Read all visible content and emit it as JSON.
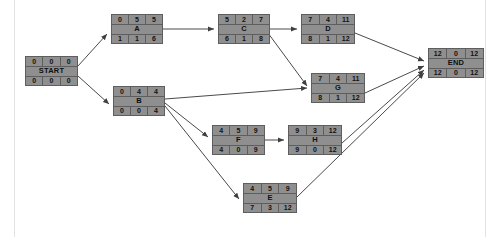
{
  "diagram": {
    "type": "activity-on-node-network",
    "title": "",
    "colors": {
      "node_fill": "#8f8f8f",
      "node_border": "#5e5e5e",
      "edge": "#4a4a4a",
      "background": "#ffffff",
      "frame_border": "#e3e3e3"
    },
    "cell_headers": {
      "top": [
        "early_start",
        "duration",
        "early_finish"
      ],
      "bottom": [
        "late_start",
        "slack",
        "late_finish"
      ]
    },
    "nodes": [
      {
        "id": "START",
        "label": "START",
        "top": [
          "0",
          "0",
          "0"
        ],
        "bottom": [
          "0",
          "0",
          "0"
        ],
        "x": 25,
        "y": 56,
        "w": 53,
        "h": 30
      },
      {
        "id": "A",
        "label": "A",
        "top": [
          "0",
          "5",
          "5"
        ],
        "bottom": [
          "1",
          "1",
          "6"
        ],
        "x": 111,
        "y": 14,
        "w": 52,
        "h": 30
      },
      {
        "id": "B",
        "label": "B",
        "top": [
          "0",
          "4",
          "4"
        ],
        "bottom": [
          "0",
          "0",
          "4"
        ],
        "x": 113,
        "y": 86,
        "w": 52,
        "h": 30
      },
      {
        "id": "C",
        "label": "C",
        "top": [
          "5",
          "2",
          "7"
        ],
        "bottom": [
          "6",
          "1",
          "8"
        ],
        "x": 218,
        "y": 14,
        "w": 52,
        "h": 30
      },
      {
        "id": "D",
        "label": "D",
        "top": [
          "7",
          "4",
          "11"
        ],
        "bottom": [
          "8",
          "1",
          "12"
        ],
        "x": 301,
        "y": 14,
        "w": 54,
        "h": 30
      },
      {
        "id": "G",
        "label": "G",
        "top": [
          "7",
          "4",
          "11"
        ],
        "bottom": [
          "8",
          "1",
          "12"
        ],
        "x": 311,
        "y": 73,
        "w": 54,
        "h": 30
      },
      {
        "id": "F",
        "label": "F",
        "top": [
          "4",
          "5",
          "9"
        ],
        "bottom": [
          "4",
          "0",
          "9"
        ],
        "x": 212,
        "y": 125,
        "w": 53,
        "h": 30
      },
      {
        "id": "H",
        "label": "H",
        "top": [
          "9",
          "3",
          "12"
        ],
        "bottom": [
          "9",
          "0",
          "12"
        ],
        "x": 288,
        "y": 125,
        "w": 54,
        "h": 30
      },
      {
        "id": "E",
        "label": "E",
        "top": [
          "4",
          "5",
          "9"
        ],
        "bottom": [
          "7",
          "3",
          "12"
        ],
        "x": 243,
        "y": 183,
        "w": 54,
        "h": 30
      },
      {
        "id": "END",
        "label": "END",
        "top": [
          "12",
          "0",
          "12"
        ],
        "bottom": [
          "12",
          "0",
          "12"
        ],
        "x": 428,
        "y": 48,
        "w": 56,
        "h": 30
      }
    ],
    "edges": [
      {
        "from": "START",
        "to": "A",
        "path": "M 78,66 L 107,34"
      },
      {
        "from": "START",
        "to": "B",
        "path": "M 78,76 L 109,104"
      },
      {
        "from": "A",
        "to": "C",
        "path": "M 163,29 L 214,29"
      },
      {
        "from": "C",
        "to": "D",
        "path": "M 270,29 L 297,29"
      },
      {
        "from": "C",
        "to": "G",
        "path": "M 268,33 L 307,86"
      },
      {
        "from": "B",
        "to": "G",
        "path": "M 165,99 L 307,88"
      },
      {
        "from": "B",
        "to": "F",
        "path": "M 165,103 L 208,137"
      },
      {
        "from": "B",
        "to": "E",
        "path": "M 165,106 L 239,199"
      },
      {
        "from": "F",
        "to": "H",
        "path": "M 265,140 L 284,140"
      },
      {
        "from": "D",
        "to": "END",
        "path": "M 355,33 L 424,61"
      },
      {
        "from": "G",
        "to": "END",
        "path": "M 365,93 L 424,66"
      },
      {
        "from": "H",
        "to": "END",
        "path": "M 342,143 L 424,70"
      },
      {
        "from": "E",
        "to": "END",
        "path": "M 297,197 L 424,73"
      }
    ]
  }
}
